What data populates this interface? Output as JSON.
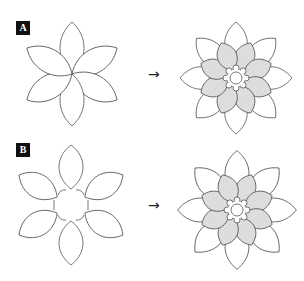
{
  "panels": [
    {
      "label": "A",
      "arrow": "→",
      "left_flower": {
        "type": "six-petal, petals meeting at center",
        "petals": 6
      },
      "right_flower": {
        "type": "layered flower",
        "outer_petals": 8,
        "inner_petals": 8,
        "inner_fill": "#d9d9d9",
        "center": "cog ring with circle"
      }
    },
    {
      "label": "B",
      "arrow": "→",
      "left_flower": {
        "type": "six-petal with hexagonal center gap",
        "petals": 6
      },
      "right_flower": {
        "type": "layered flower",
        "outer_petals": 8,
        "inner_petals": 8,
        "inner_fill": "#d9d9d9",
        "center": "cog ring with circle"
      }
    }
  ],
  "colors": {
    "stroke": "#555555",
    "fill_inner": "#dcdcdc",
    "label_bg": "#111111",
    "label_fg": "#ffffff"
  }
}
